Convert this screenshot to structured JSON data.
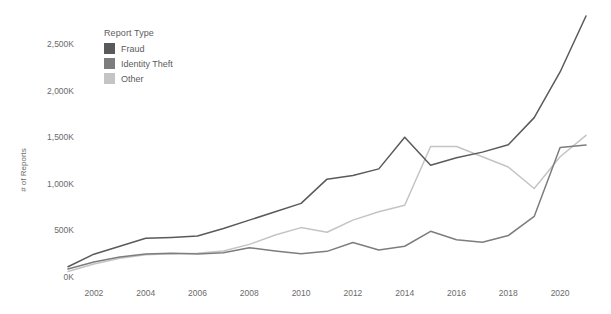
{
  "legend": {
    "title": "Report Type",
    "position": "inside-top-left",
    "entries": [
      {
        "label": "Fraud",
        "color": "#5a5a5a"
      },
      {
        "label": "Identity Theft",
        "color": "#7d7d7d"
      },
      {
        "label": "Other",
        "color": "#c4c4c4"
      }
    ]
  },
  "axes": {
    "y_title": "# of Reports",
    "x_title": "",
    "y_ticks": [
      "0K",
      "500K",
      "1,000K",
      "1,500K",
      "2,000K",
      "2,500K"
    ],
    "x_ticks": [
      "2002",
      "2004",
      "2006",
      "2008",
      "2010",
      "2012",
      "2014",
      "2016",
      "2018",
      "2020"
    ]
  },
  "chart_data": {
    "type": "line",
    "title": "",
    "subtitle": "",
    "xlabel": "",
    "ylabel": "# of Reports",
    "grid": false,
    "legend_position": "inside-top-left",
    "xlim": [
      2001,
      2021
    ],
    "ylim": [
      0,
      2800
    ],
    "y_tick_values": [
      0,
      500,
      1000,
      1500,
      2000,
      2500
    ],
    "y_tick_labels": [
      "0K",
      "500K",
      "1,000K",
      "1,500K",
      "2,000K",
      "2,500K"
    ],
    "x_tick_values": [
      2002,
      2004,
      2006,
      2008,
      2010,
      2012,
      2014,
      2016,
      2018,
      2020
    ],
    "x_tick_labels": [
      "2002",
      "2004",
      "2006",
      "2008",
      "2010",
      "2012",
      "2014",
      "2016",
      "2018",
      "2020"
    ],
    "value_units": "thousands of reports",
    "x": [
      2001,
      2002,
      2003,
      2004,
      2005,
      2006,
      2007,
      2008,
      2009,
      2010,
      2011,
      2012,
      2013,
      2014,
      2015,
      2016,
      2017,
      2018,
      2019,
      2020,
      2021
    ],
    "series": [
      {
        "name": "Fraud",
        "color": "#5a5a5a",
        "values": [
          110,
          245,
          330,
          415,
          425,
          440,
          520,
          610,
          700,
          790,
          1050,
          1090,
          1160,
          1500,
          1200,
          1280,
          1340,
          1420,
          1710,
          2200,
          2800
        ]
      },
      {
        "name": "Identity Theft",
        "color": "#7d7d7d",
        "values": [
          86,
          160,
          215,
          246,
          256,
          248,
          260,
          315,
          280,
          250,
          275,
          370,
          290,
          330,
          490,
          400,
          372,
          445,
          650,
          1390,
          1415
        ]
      },
      {
        "name": "Other",
        "color": "#c4c4c4",
        "values": [
          60,
          140,
          200,
          238,
          250,
          255,
          280,
          350,
          450,
          530,
          480,
          610,
          700,
          770,
          1400,
          1400,
          1290,
          1180,
          950,
          1290,
          1520
        ]
      }
    ]
  }
}
